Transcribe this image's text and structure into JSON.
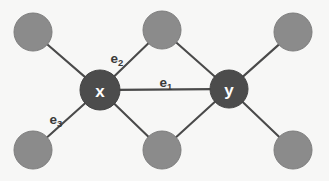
{
  "figure": {
    "name": "graph-diagram",
    "background_color": "#f7f7f6",
    "width": 329,
    "height": 181,
    "node_light_color": "#8b8b8b",
    "node_dark_color": "#4c4c4c",
    "edge_color": "#4a4a4a",
    "node_label_color": "#ffffff",
    "edge_label_color": "#3a3a3a"
  },
  "nodes": [
    {
      "id": "n1",
      "label": "",
      "type": "light",
      "cx": 33,
      "cy": 32,
      "r": 19
    },
    {
      "id": "n2",
      "label": "",
      "type": "light",
      "cx": 162,
      "cy": 30,
      "r": 19
    },
    {
      "id": "n3",
      "label": "",
      "type": "light",
      "cx": 293,
      "cy": 32,
      "r": 19
    },
    {
      "id": "x",
      "label": "x",
      "type": "dark",
      "cx": 100,
      "cy": 90,
      "r": 20
    },
    {
      "id": "y",
      "label": "y",
      "type": "dark",
      "cx": 229,
      "cy": 89,
      "r": 19
    },
    {
      "id": "n4",
      "label": "",
      "type": "light",
      "cx": 33,
      "cy": 150,
      "r": 19
    },
    {
      "id": "n5",
      "label": "",
      "type": "light",
      "cx": 162,
      "cy": 150,
      "r": 19
    },
    {
      "id": "n6",
      "label": "",
      "type": "light",
      "cx": 293,
      "cy": 150,
      "r": 19
    }
  ],
  "edges": [
    {
      "id": "x-n1",
      "from": "x",
      "to": "n1",
      "label": "",
      "label_sub": ""
    },
    {
      "id": "e2",
      "from": "x",
      "to": "n2",
      "label": "e",
      "label_sub": "2"
    },
    {
      "id": "e1",
      "from": "x",
      "to": "y",
      "label": "e",
      "label_sub": "1"
    },
    {
      "id": "e3",
      "from": "x",
      "to": "n4",
      "label": "e",
      "label_sub": "3"
    },
    {
      "id": "x-n5",
      "from": "x",
      "to": "n5",
      "label": "",
      "label_sub": ""
    },
    {
      "id": "y-n2",
      "from": "y",
      "to": "n2",
      "label": "",
      "label_sub": ""
    },
    {
      "id": "y-n3",
      "from": "y",
      "to": "n3",
      "label": "",
      "label_sub": ""
    },
    {
      "id": "y-n5",
      "from": "y",
      "to": "n5",
      "label": "",
      "label_sub": ""
    },
    {
      "id": "y-n6",
      "from": "y",
      "to": "n6",
      "label": "",
      "label_sub": ""
    }
  ],
  "edge_labels": [
    {
      "id": "label-e2",
      "base": "e",
      "sub": "2",
      "x": 117,
      "y": 58
    },
    {
      "id": "label-e1",
      "base": "e",
      "sub": "1",
      "x": 166,
      "y": 82
    },
    {
      "id": "label-e3",
      "base": "e",
      "sub": "3",
      "x": 56,
      "y": 119
    }
  ],
  "node_labels": [
    {
      "id": "label-x",
      "text": "x",
      "x": 100,
      "y": 91
    },
    {
      "id": "label-y",
      "text": "y",
      "x": 229,
      "y": 90
    }
  ]
}
